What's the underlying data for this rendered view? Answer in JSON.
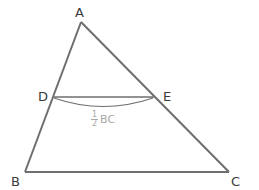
{
  "diagram": {
    "type": "triangle-midsegment",
    "colors": {
      "lines": "#6e6e6e",
      "labels": "#3a3a3a",
      "annotation": "#a8a8a8",
      "background": "#ffffff"
    },
    "vertices": {
      "A": {
        "label": "A",
        "x": 81,
        "y": 22
      },
      "B": {
        "label": "B",
        "x": 25,
        "y": 172
      },
      "C": {
        "label": "C",
        "x": 229,
        "y": 172
      },
      "D": {
        "label": "D",
        "x": 53,
        "y": 97
      },
      "E": {
        "label": "E",
        "x": 154,
        "y": 97
      }
    },
    "segments": [
      "AB",
      "AC",
      "BC",
      "DE"
    ],
    "annotation": {
      "numerator": "1",
      "denominator": "2",
      "text": "BC",
      "description": "DE = 1/2 BC"
    }
  }
}
